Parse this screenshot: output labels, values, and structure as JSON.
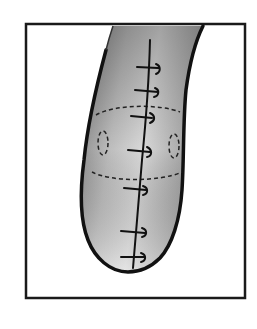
{
  "figure": {
    "type": "illustration",
    "colors": {
      "background": "#ffffff",
      "ink": "#1a1a1a",
      "tissue_light": "#e6e6e6",
      "tissue_dark": "#8c8c8c"
    }
  }
}
